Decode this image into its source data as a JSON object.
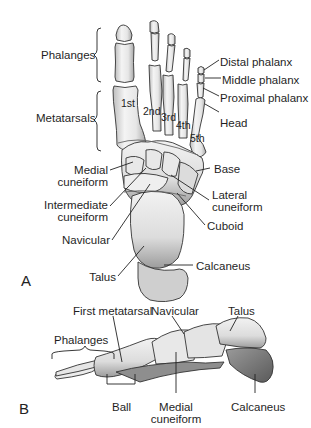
{
  "figure": {
    "panel_a": {
      "letter": "A",
      "view": "dorsal view of right foot skeleton",
      "group_labels": {
        "phalanges": "Phalanges",
        "metatarsals": "Metatarsals"
      },
      "metatarsal_numbers": [
        "1st",
        "2nd",
        "3rd",
        "4th",
        "5th"
      ],
      "right_labels": {
        "distal_phalanx": "Distal phalanx",
        "middle_phalanx": "Middle phalanx",
        "proximal_phalanx": "Proximal phalanx",
        "head": "Head",
        "base": "Base",
        "lateral_cuneiform_1": "Lateral",
        "lateral_cuneiform_2": "cuneiform",
        "cuboid": "Cuboid",
        "calcaneus": "Calcaneus"
      },
      "left_labels": {
        "medial_cuneiform_1": "Medial",
        "medial_cuneiform_2": "cuneiform",
        "intermediate_cuneiform_1": "Intermediate",
        "intermediate_cuneiform_2": "cuneiform",
        "navicular": "Navicular",
        "talus": "Talus"
      }
    },
    "panel_b": {
      "letter": "B",
      "view": "medial side view of foot skeleton",
      "labels": {
        "first_metatarsal": "First metatarsal",
        "navicular": "Navicular",
        "talus": "Talus",
        "phalanges": "Phalanges",
        "ball": "Ball",
        "medial_cuneiform_1": "Medial",
        "medial_cuneiform_2": "cuneiform",
        "calcaneus": "Calcaneus"
      }
    },
    "colors": {
      "bone_fill": "#ececec",
      "bone_shadow": "#9a9a9a",
      "dark_shadow": "#6d6d6d",
      "outline": "#333333",
      "text": "#222222"
    }
  }
}
